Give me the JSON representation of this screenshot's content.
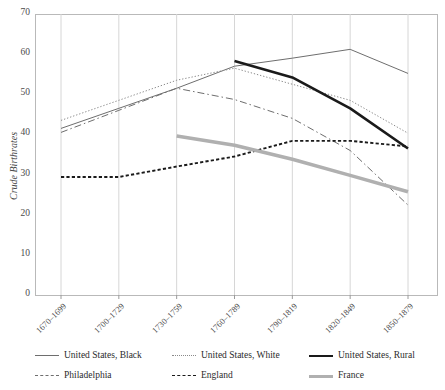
{
  "chart_data": {
    "type": "line",
    "title": "",
    "xlabel": "",
    "ylabel": "Crude Birthrates",
    "ylim": [
      0,
      70
    ],
    "yticks": [
      0,
      10,
      20,
      30,
      40,
      50,
      60,
      70
    ],
    "grid": "vertical",
    "legend_position": "bottom",
    "categories": [
      "1670–1699",
      "1700–1729",
      "1730–1759",
      "1760–1789",
      "1790–1819",
      "1820–1849",
      "1850–1879"
    ],
    "series": [
      {
        "name": "United States, Black",
        "style": "solid-thin",
        "color": "#6e6e6e",
        "values": [
          41.5,
          46.5,
          51.5,
          57.0,
          59.0,
          61.2,
          55.2
        ]
      },
      {
        "name": "United States, White",
        "style": "dotted",
        "color": "#8a8a8a",
        "values": [
          43.5,
          48.5,
          53.5,
          56.5,
          52.5,
          48.5,
          40.3
        ]
      },
      {
        "name": "United States, Rural",
        "style": "solid-thick",
        "color": "#1a1a1a",
        "values": [
          null,
          null,
          null,
          58.3,
          54.2,
          46.5,
          36.5
        ]
      },
      {
        "name": "Philadelphia",
        "style": "dash-dot",
        "color": "#6e6e6e",
        "values": [
          40.5,
          46.0,
          51.5,
          48.7,
          44.0,
          36.0,
          22.4
        ]
      },
      {
        "name": "England",
        "style": "dashed",
        "color": "#1a1a1a",
        "values": [
          29.4,
          29.4,
          32.0,
          34.5,
          38.4,
          38.4,
          37.0
        ]
      },
      {
        "name": "France",
        "style": "thick-gray",
        "color": "#b0b0b0",
        "values": [
          null,
          null,
          39.6,
          37.3,
          33.8,
          29.8,
          25.7
        ]
      }
    ]
  },
  "legend": {
    "items": [
      {
        "label": "United States, Black",
        "swatch": "solid-thin"
      },
      {
        "label": "United States, White",
        "swatch": "dotted"
      },
      {
        "label": "United States, Rural",
        "swatch": "solid-thick"
      },
      {
        "label": "Philadelphia",
        "swatch": "dash-dot"
      },
      {
        "label": "England",
        "swatch": "dashed"
      },
      {
        "label": "France",
        "swatch": "thick-gray"
      }
    ]
  },
  "axes": {
    "y_label": "Crude Birthrates"
  }
}
